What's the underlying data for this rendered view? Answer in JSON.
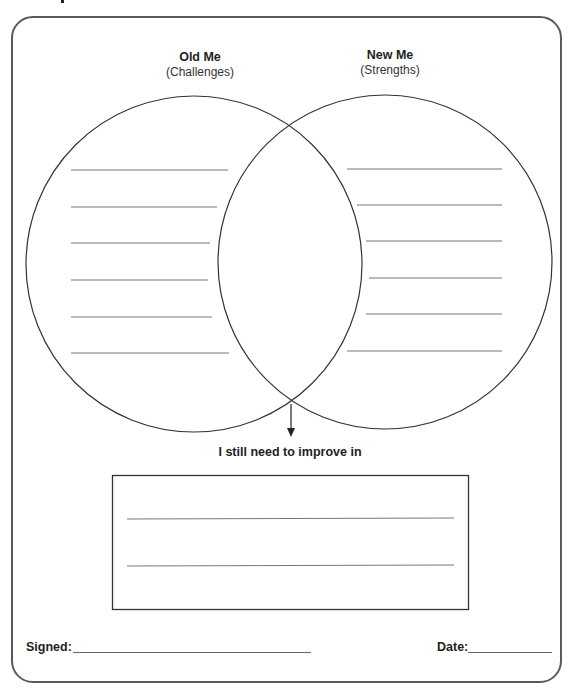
{
  "worksheet": {
    "left_circle": {
      "title": "Old Me",
      "subtitle": "(Challenges)",
      "blank_lines": 6
    },
    "right_circle": {
      "title": "New Me",
      "subtitle": "(Strengths)",
      "blank_lines": 6
    },
    "improve_box": {
      "label": "I still need to improve in",
      "blank_lines": 2
    },
    "footer": {
      "signed_label": "Signed:",
      "date_label": "Date:"
    }
  },
  "colors": {
    "ink": "#231f20",
    "frame_border": "#5a5a5a",
    "rule_line": "#777777"
  }
}
